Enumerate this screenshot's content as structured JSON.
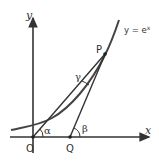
{
  "diagram": {
    "axes": {
      "x_label": "x",
      "y_label": "y"
    },
    "curve_label": "y = e",
    "curve_label_sup": "x",
    "points": {
      "O": "O",
      "P": "P",
      "Q": "Q"
    },
    "angles": {
      "alpha": "α",
      "beta": "β",
      "gamma": "γ"
    },
    "colors": {
      "line": "#333333",
      "curve": "#444444",
      "background": "#ffffff"
    }
  }
}
